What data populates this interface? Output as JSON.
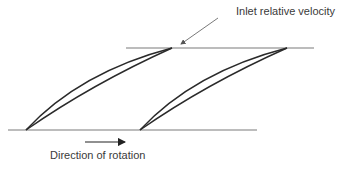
{
  "diagram": {
    "labels": {
      "inlet_relative_velocity": "Inlet relative velocity",
      "direction_of_rotation": "Direction of rotation"
    },
    "colors": {
      "line": "#7a7a7a",
      "blade": "#2a2a2a",
      "text": "#3a3a3a",
      "background": "#ffffff"
    },
    "elements": {
      "top_line": {
        "x1": 126,
        "y1": 48,
        "x2": 314,
        "y2": 48
      },
      "bottom_line": {
        "x1": 8,
        "y1": 130,
        "x2": 257,
        "y2": 130
      },
      "blades": [
        {
          "name": "blade-1",
          "leading_edge": [
            26,
            130
          ],
          "trailing_edge": [
            172,
            48
          ]
        },
        {
          "name": "blade-2",
          "leading_edge": [
            140,
            130
          ],
          "trailing_edge": [
            287,
            48
          ]
        }
      ],
      "leader_arrow": {
        "from": [
          218,
          18
        ],
        "to": [
          180,
          45
        ]
      },
      "rotation_arrow": {
        "from": [
          85,
          142
        ],
        "to": [
          127,
          142
        ]
      }
    }
  }
}
